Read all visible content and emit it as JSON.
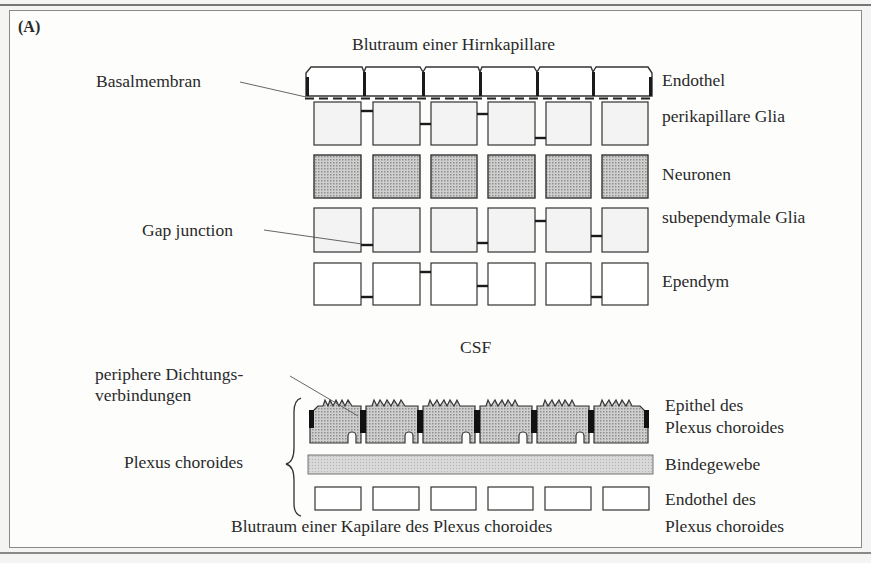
{
  "panel_label": "(A)",
  "top": {
    "title": "Blutraum einer Hirnkapillare",
    "callouts": {
      "basal_membrane": "Basalmembran",
      "gap_junction": "Gap junction"
    },
    "layers": [
      {
        "id": "endothel",
        "label": "Endothel",
        "cells": 6,
        "fill": "#ffffff"
      },
      {
        "id": "perikapillare-glia",
        "label": "perikapillare Glia",
        "cells": 6,
        "fill": "#f2f2f2"
      },
      {
        "id": "neuronen",
        "label": "Neuronen",
        "cells": 6,
        "fill": "#b9b9b9"
      },
      {
        "id": "subependymale-glia",
        "label": "subependymale Glia",
        "cells": 6,
        "fill": "#f2f2f2"
      },
      {
        "id": "ependym",
        "label": "Ependym",
        "cells": 6,
        "fill": "#ffffff"
      }
    ]
  },
  "csf_label": "CSF",
  "bottom": {
    "callouts": {
      "tight_junctions_line1": "periphere Dichtungs-",
      "tight_junctions_line2": "verbindungen",
      "brace_label": "Plexus choroides"
    },
    "layers": [
      {
        "id": "epithel-plexus",
        "label_line1": "Epithel des",
        "label_line2": "Plexus choroides",
        "cells": 6,
        "fill": "#b5b5b5"
      },
      {
        "id": "bindegewebe",
        "label": "Bindegewebe",
        "fill": "#cfcfcf"
      },
      {
        "id": "endothel-plexus",
        "label_line1": "Endothel des",
        "label_line2": "Plexus choroides",
        "cells": 6,
        "fill": "#ffffff"
      }
    ],
    "caption": "Blutraum einer Kapilare des Plexus choroides"
  },
  "colors": {
    "stroke": "#333333",
    "junction": "#1a1a1a",
    "frame": "#8a8a8a",
    "background": "#fdfdfc"
  }
}
